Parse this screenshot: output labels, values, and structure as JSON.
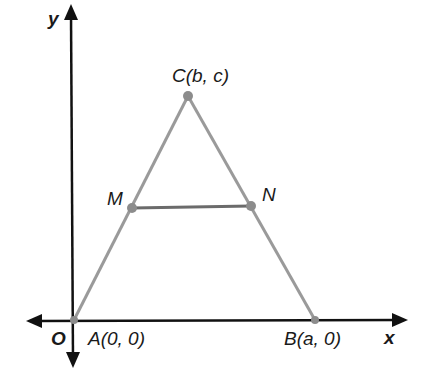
{
  "diagram": {
    "type": "coordinate-geometry",
    "axes": {
      "x_label": "x",
      "y_label": "y",
      "origin_label": "O"
    },
    "points": [
      {
        "id": "A",
        "label": "A(0, 0)",
        "x": 74,
        "y": 320
      },
      {
        "id": "B",
        "label": "B(a, 0)",
        "x": 315,
        "y": 320
      },
      {
        "id": "C",
        "label": "C(b, c)",
        "x": 188,
        "y": 96
      },
      {
        "id": "M",
        "label": "M",
        "x": 132,
        "y": 208
      },
      {
        "id": "N",
        "label": "N",
        "x": 251,
        "y": 206
      }
    ],
    "segments": [
      {
        "from": "A",
        "to": "C",
        "color": "#9a9a9a"
      },
      {
        "from": "C",
        "to": "B",
        "color": "#9a9a9a"
      },
      {
        "from": "M",
        "to": "N",
        "color": "#6b6b6b"
      }
    ],
    "colors": {
      "axis": "#111111",
      "triangle": "#9a9a9a",
      "midsegment": "#6b6b6b",
      "point": "#8c8c8c"
    }
  }
}
